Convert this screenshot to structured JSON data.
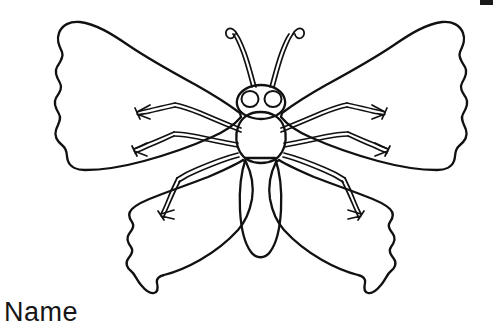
{
  "page": {
    "kind": "coloring-page",
    "width": 497,
    "height": 328,
    "background_color": "#ffffff",
    "ink_color": "#111111"
  },
  "labels": {
    "name_field": "Name"
  },
  "artwork": {
    "title": "butterfly-line-drawing",
    "description": "Black outline butterfly coloring illustration with two large scalloped upper wings, two scalloped lower wings, oval abdomen, rounded thorax, round head with two circular eyes, two curled antennae, and three pairs of jointed legs with claw tips.",
    "parts": [
      "left-upper-wing",
      "right-upper-wing",
      "left-lower-wing",
      "right-lower-wing",
      "abdomen",
      "thorax",
      "head",
      "left-eye",
      "right-eye",
      "left-antenna",
      "right-antenna",
      "left-legs",
      "right-legs"
    ]
  },
  "corner": {
    "mark": "black-edge-mark"
  }
}
